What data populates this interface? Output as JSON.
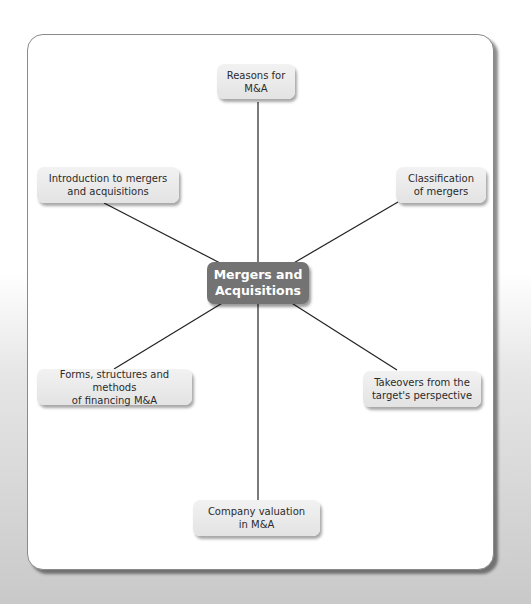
{
  "diagram": {
    "type": "mind-map",
    "center": {
      "label_line1": "Mergers and",
      "label_line2": "Acquisitions"
    },
    "nodes": [
      {
        "id": "reasons",
        "line1": "Reasons for",
        "line2": "M&A"
      },
      {
        "id": "introduction",
        "line1": "Introduction to mergers",
        "line2": "and acquisitions"
      },
      {
        "id": "classification",
        "line1": "Classification",
        "line2": "of mergers"
      },
      {
        "id": "forms",
        "line1": "Forms, structures and methods",
        "line2": "of financing M&A"
      },
      {
        "id": "takeovers",
        "line1": "Takeovers from the",
        "line2": "target's perspective"
      },
      {
        "id": "valuation",
        "line1": "Company valuation",
        "line2": "in M&A"
      }
    ],
    "colors": {
      "center_fill": "#737373",
      "node_fill": "#e9e9e9",
      "line": "#222222"
    }
  }
}
